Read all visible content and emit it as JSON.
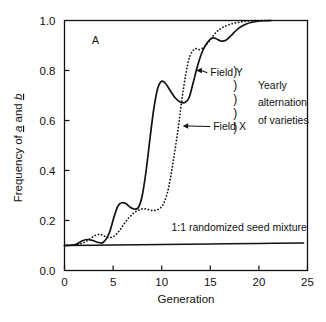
{
  "figure": {
    "panel_label": "A",
    "background_color": "#ffffff",
    "ink_color": "#111111"
  },
  "chart_data": {
    "type": "line",
    "title": "",
    "subtitle": "",
    "panel": "A",
    "xlabel": "Generation",
    "ylabel": "Frequency of a and b",
    "ylabel_parts": [
      "Frequency of ",
      "a",
      " and ",
      "b"
    ],
    "xlim": [
      0,
      25
    ],
    "ylim": [
      0.0,
      1.0
    ],
    "xticks": [
      0,
      5,
      10,
      15,
      20,
      25
    ],
    "xtick_labels": [
      "0",
      "5",
      "10",
      "15",
      "20",
      "25"
    ],
    "yticks": [
      0.0,
      0.2,
      0.4,
      0.6,
      0.8,
      1.0
    ],
    "ytick_labels": [
      "0.0",
      "0.2",
      "0.4",
      "0.6",
      "0.8",
      "1.0"
    ],
    "grid": false,
    "legend": "inline-annotations",
    "series": [
      {
        "name": "Field X",
        "style": "solid",
        "x": [
          0,
          0.6,
          1.2,
          1.8,
          2.3,
          2.9,
          3.5,
          4.0,
          4.6,
          5.1,
          5.5,
          5.9,
          6.3,
          6.8,
          7.2,
          7.6,
          8.0,
          8.4,
          8.8,
          9.2,
          9.6,
          10.0,
          10.4,
          10.9,
          11.4,
          11.9,
          12.4,
          12.8,
          13.2,
          13.7,
          14.2,
          14.7,
          15.2,
          15.6,
          16.1,
          16.6,
          17.1,
          17.6,
          18.1,
          18.7,
          19.3,
          19.9,
          20.5,
          21.2
        ],
        "y": [
          0.1,
          0.101,
          0.105,
          0.118,
          0.124,
          0.12,
          0.112,
          0.113,
          0.15,
          0.215,
          0.258,
          0.271,
          0.268,
          0.252,
          0.246,
          0.252,
          0.3,
          0.4,
          0.53,
          0.65,
          0.73,
          0.757,
          0.748,
          0.718,
          0.69,
          0.674,
          0.672,
          0.69,
          0.745,
          0.82,
          0.878,
          0.912,
          0.93,
          0.927,
          0.918,
          0.921,
          0.938,
          0.958,
          0.974,
          0.986,
          0.993,
          0.997,
          0.999,
          1.0
        ]
      },
      {
        "name": "Field Y",
        "style": "dotted",
        "x": [
          0,
          0.7,
          1.4,
          2.0,
          2.6,
          3.2,
          3.7,
          4.2,
          4.7,
          5.2,
          5.7,
          6.2,
          6.7,
          7.2,
          7.7,
          8.2,
          8.7,
          9.2,
          9.7,
          10.2,
          10.7,
          11.2,
          11.7,
          12.1,
          12.5,
          12.9,
          13.4,
          13.9,
          14.4,
          14.9,
          15.4,
          15.9,
          16.4,
          16.9,
          17.5,
          18.1,
          18.7,
          19.4,
          20.1,
          20.8,
          21.4
        ],
        "y": [
          0.1,
          0.101,
          0.104,
          0.112,
          0.126,
          0.141,
          0.144,
          0.136,
          0.132,
          0.14,
          0.162,
          0.19,
          0.214,
          0.232,
          0.243,
          0.247,
          0.243,
          0.24,
          0.246,
          0.268,
          0.33,
          0.44,
          0.57,
          0.69,
          0.79,
          0.858,
          0.886,
          0.884,
          0.895,
          0.918,
          0.944,
          0.963,
          0.975,
          0.983,
          0.99,
          0.994,
          0.997,
          0.999,
          1.0,
          1.0,
          1.0
        ]
      },
      {
        "name": "1:1 randomized seed mixture",
        "style": "flat",
        "x": [
          0,
          5,
          10,
          15,
          20,
          24.6
        ],
        "y": [
          0.1,
          0.102,
          0.104,
          0.106,
          0.108,
          0.11
        ]
      }
    ],
    "annotations": [
      {
        "id": "field-y",
        "text": "Field Y",
        "x": 15.0,
        "y": 0.793,
        "arrow_to_x": 13.55,
        "arrow_to_y": 0.8
      },
      {
        "id": "field-x",
        "text": "Field X",
        "x": 15.3,
        "y": 0.578,
        "arrow_to_x": 12.15,
        "arrow_to_y": 0.578
      },
      {
        "id": "seed-mixture",
        "text": "1:1 randomized seed mixture",
        "x": 11.0,
        "y": 0.172
      },
      {
        "id": "brace-note-line-1",
        "text": "Yearly",
        "x": 19.9,
        "y": 0.742
      },
      {
        "id": "brace-note-line-2",
        "text": "alternation",
        "x": 19.9,
        "y": 0.672
      },
      {
        "id": "brace-note-line-3",
        "text": "of varieties",
        "x": 19.9,
        "y": 0.602
      }
    ],
    "brace": {
      "glyph": ")",
      "count": 5,
      "spans_annotations": [
        "Field Y",
        "Field X"
      ],
      "note": "Yearly alternation of varieties"
    }
  }
}
